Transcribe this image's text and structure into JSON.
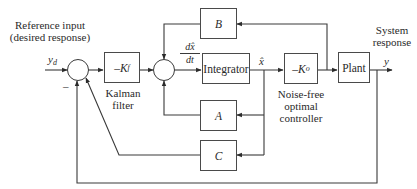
{
  "diagram": {
    "labels": {
      "reference_input_line1": "Reference input",
      "reference_input_line2": "(desired response)",
      "reference_signal": "y",
      "reference_signal_sub": "d",
      "minus_sign": "–",
      "kalman_filter_line1": "Kalman",
      "kalman_filter_line2": "filter",
      "derivative_num": "dx̂",
      "derivative_den": "dt",
      "state_estimate": "x̂",
      "controller_line1": "Noise-free",
      "controller_line2": "optimal",
      "controller_line3": "controller",
      "system_response_line1": "System",
      "system_response_line2": "response",
      "output_signal": "y"
    },
    "blocks": {
      "kalman_gain": {
        "prefix": "–K",
        "sub": "f"
      },
      "B": "B",
      "integrator": "Integrator",
      "controller_gain": {
        "prefix": "–K",
        "sub": "o"
      },
      "plant": "Plant",
      "A": "A",
      "C": "C"
    },
    "colors": {
      "line": "#3a3a3a",
      "text": "#2a2a2a",
      "background": "#ffffff"
    }
  }
}
